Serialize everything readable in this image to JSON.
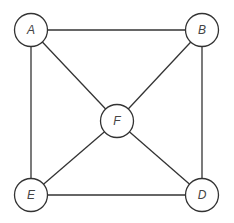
{
  "diagram": {
    "type": "graph",
    "stroke_color": "#333333",
    "label_color": "#444444",
    "node_radius": 16.5,
    "nodes": [
      {
        "id": "A",
        "label": "A",
        "x": 31,
        "y": 30
      },
      {
        "id": "B",
        "label": "B",
        "x": 202,
        "y": 30
      },
      {
        "id": "F",
        "label": "F",
        "x": 117,
        "y": 121
      },
      {
        "id": "E",
        "label": "E",
        "x": 31,
        "y": 195
      },
      {
        "id": "D",
        "label": "D",
        "x": 202,
        "y": 195
      }
    ],
    "edges": [
      {
        "from": "A",
        "to": "B"
      },
      {
        "from": "A",
        "to": "E"
      },
      {
        "from": "A",
        "to": "F"
      },
      {
        "from": "B",
        "to": "D"
      },
      {
        "from": "B",
        "to": "F"
      },
      {
        "from": "E",
        "to": "F"
      },
      {
        "from": "E",
        "to": "D"
      },
      {
        "from": "F",
        "to": "D"
      }
    ]
  }
}
